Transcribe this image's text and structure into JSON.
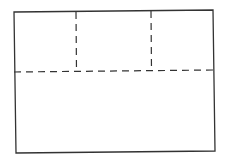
{
  "diagram": {
    "stroke_color": "#333333",
    "background": "#ffffff",
    "outer_rect": {
      "tl": [
        14,
        12
      ],
      "tr": [
        213,
        10
      ],
      "br": [
        215,
        151
      ],
      "bl": [
        16,
        153
      ]
    },
    "horizontal_divider": {
      "from": [
        14,
        72
      ],
      "to": [
        213,
        70
      ],
      "style": "dashed"
    },
    "vertical_dividers": [
      {
        "from": [
          76,
          12
        ],
        "to": [
          76,
          71
        ],
        "style": "dashed"
      },
      {
        "from": [
          151,
          11
        ],
        "to": [
          151,
          70
        ],
        "style": "dashed"
      }
    ],
    "regions": [
      {
        "name": "top-left-cell"
      },
      {
        "name": "top-middle-cell"
      },
      {
        "name": "top-right-cell"
      },
      {
        "name": "bottom-region"
      }
    ]
  }
}
